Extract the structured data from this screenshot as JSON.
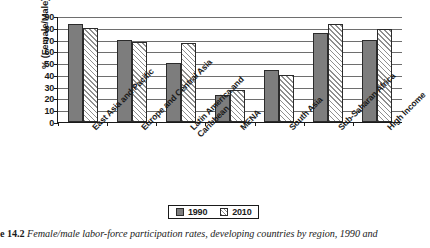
{
  "chart_data": {
    "type": "bar",
    "title": "",
    "xlabel": "",
    "ylabel": "% (Female/Male)",
    "ylim": [
      0,
      90
    ],
    "ytick_step": 10,
    "yticks": [
      0,
      10,
      20,
      30,
      40,
      50,
      60,
      70,
      80,
      90
    ],
    "grid": true,
    "legend_position": "bottom-center",
    "categories": [
      "East Asia and Pacific",
      "Europe and Central Asia",
      "Latin America and Caribbean",
      "MENA",
      "South Asia",
      "Sub-Saharan Africa",
      "High Income"
    ],
    "series": [
      {
        "name": "1990",
        "style": "solid-gray",
        "color": "#7d7d7d",
        "values": [
          83,
          70,
          50,
          23,
          44,
          76,
          70
        ]
      },
      {
        "name": "2010",
        "style": "diagonal-hatch",
        "color": "#8f8f8f",
        "values": [
          80,
          68,
          67,
          27,
          40,
          83,
          79
        ]
      }
    ]
  },
  "axis": {
    "y_title": "% (Female/Male)",
    "y_tick_labels": [
      "90",
      "80",
      "70",
      "60",
      "50",
      "40",
      "30",
      "20",
      "10",
      "0"
    ]
  },
  "legend": {
    "items": [
      {
        "label": "1990"
      },
      {
        "label": "2010"
      }
    ]
  },
  "caption": {
    "figure_number": "e 14.2",
    "text": "Female/male labor-force participation rates, developing countries by region, 1990 and"
  }
}
